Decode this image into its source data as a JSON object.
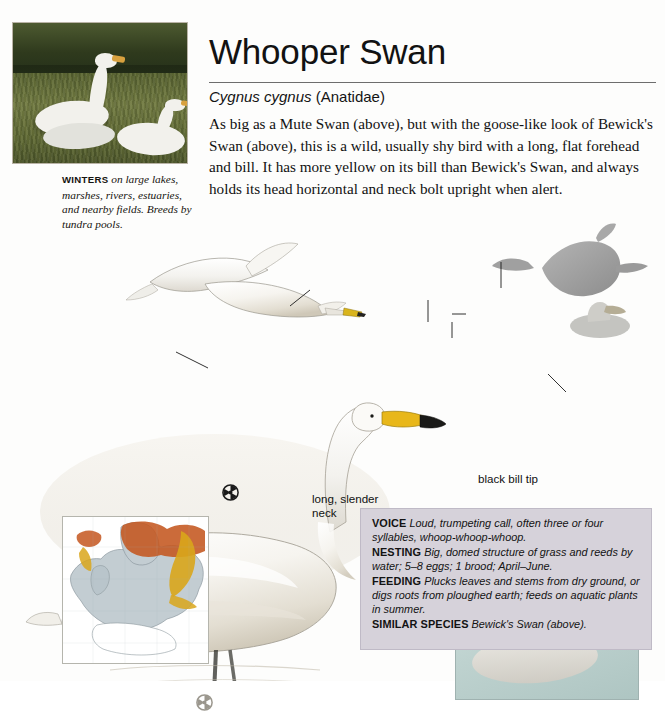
{
  "page": {
    "species_title": "Whooper Swan",
    "scientific_name": "Cygnus cygnus",
    "family": "(Anatidae)",
    "description": "As big as a Mute Swan (above), but with the goose-like look of Bewick's Swan (above), this is a wild, usually shy bird with a long, flat forehead and bill. It has more yellow on its bill than Bewick's Swan, and always holds its head horizontal and neck bolt upright when alert."
  },
  "habitat_caption": {
    "keyword": "WINTERS",
    "text": "on large lakes, marshes, rivers, estuaries, and nearby fields. Breeds by tundra pools."
  },
  "annotations": [
    {
      "id": "long-slender-neck",
      "text": "long, slender neck"
    },
    {
      "id": "black-bill-tip",
      "text": "black bill tip"
    },
    {
      "id": "yellow-wedge",
      "text": "yellow wedge extends beyond nostrils"
    },
    {
      "id": "cream-bill",
      "text": "cream bill"
    },
    {
      "id": "all-white-plumage",
      "text": "all-white plumage"
    },
    {
      "id": "greyish-body",
      "text": "greyish body"
    }
  ],
  "icons": [
    {
      "id": "adult-symbol-flying",
      "glyph": "adult"
    },
    {
      "id": "adult-symbol-swimming",
      "glyph": "adult"
    },
    {
      "id": "juvenile-symbol",
      "glyph": "juvenile"
    }
  ],
  "infobox": [
    {
      "key": "VOICE",
      "value": "Loud, trumpeting call, often three or four syllables, whoop-whoop-whoop."
    },
    {
      "key": "NESTING",
      "value": "Big, domed structure of grass and reeds by water; 5–8 eggs; 1 brood; April–June."
    },
    {
      "key": "FEEDING",
      "value": "Plucks leaves and stems from dry ground, or digs roots from ploughed earth; feeds on aquatic plants in summer."
    },
    {
      "key": "SIMILAR SPECIES",
      "value": "Bewick's Swan (above)."
    }
  ],
  "map": {
    "name": "distribution-map",
    "breeding_color": "#c4561f",
    "wintering_color": "#d9a61b",
    "land_color": "#c3cdd2",
    "sea_color": "#ffffff"
  },
  "colors": {
    "bill_yellow": "#e8b71a",
    "bill_black": "#1a1a18",
    "plumage_white": "#f4f3ef",
    "juvenile_grey": "#cfccc4",
    "infobox_bg": "#d6d2da"
  }
}
